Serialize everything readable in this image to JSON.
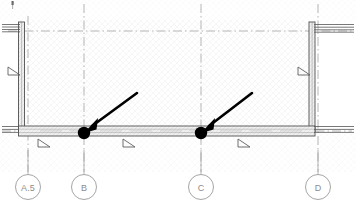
{
  "drawing": {
    "title": "Architectural Floor Plan Fragment",
    "type": "plan-view",
    "canvas": {
      "width": 356,
      "height": 205
    },
    "colors": {
      "background": "#ffffff",
      "hatch_fill": "#fcfcfc",
      "wall_line": "#4a4a4a",
      "wall_fill": "#f2f2f2",
      "grid_line": "#9a9a9a",
      "bubble_stroke": "#9b9b9b",
      "bubble_text": "#8c8c8c",
      "annotation_black": "#000000",
      "marker_gray": "#6e6e6e"
    }
  },
  "grid_bubbles": [
    {
      "id": "bubble-a5",
      "label": "A.5",
      "cx": 28,
      "cy": 187,
      "r": 12.5,
      "line_top": 150
    },
    {
      "id": "bubble-b",
      "label": "B",
      "cx": 84,
      "cy": 187,
      "r": 12.5,
      "line_top": 150
    },
    {
      "id": "bubble-c",
      "label": "C",
      "cx": 201,
      "cy": 187,
      "r": 12.5,
      "line_top": 150
    },
    {
      "id": "bubble-d",
      "label": "D",
      "cx": 318,
      "cy": 187,
      "r": 12.5,
      "line_top": 150
    }
  ],
  "grid_lines": {
    "vertical": [
      {
        "name": "gridline-a5",
        "x": 28,
        "y1": 16,
        "y2": 172
      },
      {
        "name": "gridline-b",
        "x": 84,
        "y1": 4,
        "y2": 172
      },
      {
        "name": "gridline-c",
        "x": 201,
        "y1": 4,
        "y2": 172
      },
      {
        "name": "gridline-d",
        "x": 318,
        "y1": 4,
        "y2": 172
      }
    ],
    "horizontal": [
      {
        "name": "gridline-1",
        "y": 31,
        "x1": 8,
        "x2": 352
      },
      {
        "name": "gridline-2",
        "y": 131,
        "x1": 2,
        "x2": 352
      }
    ]
  },
  "walls": {
    "left_wall": {
      "name": "wall-left",
      "x": 18,
      "y": 22,
      "w": 6,
      "h": 110
    },
    "right_wall": {
      "name": "wall-right",
      "x": 309,
      "y": 22,
      "w": 6,
      "h": 110
    },
    "bottom_wall": {
      "name": "wall-bottom",
      "x": 18,
      "y": 126,
      "w": 297,
      "h": 10
    },
    "top_left_stub": {
      "name": "wall-stub-top-left",
      "x": 2,
      "y": 24,
      "w": 18,
      "h": 5
    },
    "top_right_stub": {
      "name": "wall-stub-top-right",
      "x": 314,
      "y": 24,
      "w": 40,
      "h": 5
    },
    "bottom_left_stub": {
      "name": "wall-stub-bottom-left",
      "x": 2,
      "y": 126,
      "w": 18,
      "h": 5
    },
    "bottom_right_stub": {
      "name": "wall-stub-bottom-right",
      "x": 314,
      "y": 126,
      "w": 40,
      "h": 5
    }
  },
  "annotations": {
    "leader_arrows": [
      {
        "name": "leader-arrow-left",
        "tail_x": 137,
        "tail_y": 93,
        "head_x": 88,
        "head_y": 129,
        "dot_x": 84,
        "dot_y": 133,
        "dot_r": 6
      },
      {
        "name": "leader-arrow-right",
        "tail_x": 252,
        "tail_y": 93,
        "head_x": 205,
        "head_y": 129,
        "dot_x": 201,
        "dot_y": 133,
        "dot_r": 6
      }
    ],
    "direction_markers": [
      {
        "name": "direction-marker-1",
        "x": 38,
        "y": 141,
        "orientation": "right"
      },
      {
        "name": "direction-marker-2",
        "x": 123,
        "y": 141,
        "orientation": "right"
      },
      {
        "name": "direction-marker-3",
        "x": 238,
        "y": 141,
        "orientation": "right"
      },
      {
        "name": "direction-marker-4",
        "x": 9,
        "y": 70,
        "orientation": "right"
      },
      {
        "name": "direction-marker-5",
        "x": 300,
        "y": 70,
        "orientation": "right"
      }
    ],
    "corner_tick": {
      "name": "corner-tick-top",
      "x": 12,
      "y": 2
    }
  }
}
